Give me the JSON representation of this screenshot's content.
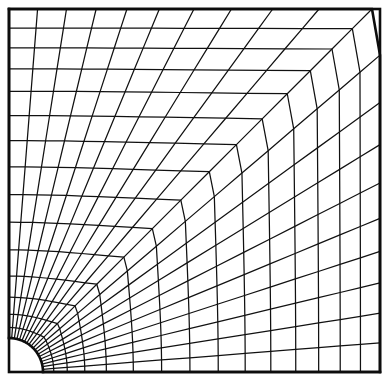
{
  "figure": {
    "kind": "mesh-diagram",
    "background_color": "#ffffff",
    "line_color": "#111111",
    "boundary_color": "#0d0d0d",
    "line_width": 1.25,
    "boundary_width": 2.6,
    "canvas": {
      "width": 390,
      "height": 385
    }
  },
  "chart_data": {
    "type": "mesh",
    "xlabel": "",
    "ylabel": "",
    "grid": false,
    "legend": null,
    "domain": {
      "shape": "square",
      "left": 9,
      "top": 9,
      "right": 380,
      "bottom": 372,
      "width": 371,
      "height": 363
    },
    "hole": {
      "shape": "quarter-circle",
      "center_x": 9,
      "center_y": 372,
      "radius": 34,
      "angle_start_deg": 0,
      "angle_end_deg": 90,
      "corner": "bottom-left"
    },
    "rings": {
      "count": 16,
      "inner_is_hole_arc": true,
      "outer_is_square_boundary": true,
      "grading": "geometric expansion outward from the hole",
      "grading_ratio": 1.27,
      "normalized_radii": [
        0.0,
        0.032,
        0.072,
        0.124,
        0.188,
        0.268,
        0.352,
        0.436,
        0.52,
        0.6,
        0.676,
        0.75,
        0.818,
        0.882,
        0.942,
        1.0
      ]
    },
    "radials": {
      "count": 21,
      "angle_start_deg": 0,
      "angle_end_deg": 90,
      "spacing": "uniform in angle at the hole, projected to the square boundary",
      "hits_bottom_edge": 10,
      "hits_right_edge": 6,
      "hits_top_edge": 6,
      "hits_left_edge": 10
    },
    "elements": {
      "type": "quadrilateral",
      "rows": 15,
      "columns": 20,
      "total": 300
    },
    "blend": {
      "mode": "circle-to-square morph",
      "exponent": 1.55
    }
  }
}
